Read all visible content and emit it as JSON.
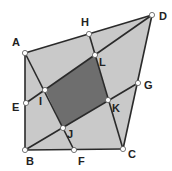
{
  "diagram": {
    "colors": {
      "outer_fill": "#c9c9c9",
      "inner_fill": "#6e6e6e",
      "stroke": "#2a2a2a",
      "point_fill": "#ffffff"
    },
    "points": {
      "A": {
        "x": 25,
        "y": 53,
        "label": "A",
        "lx": 12,
        "ly": 46
      },
      "B": {
        "x": 25,
        "y": 150,
        "label": "B",
        "lx": 26,
        "ly": 165
      },
      "C": {
        "x": 123,
        "y": 149,
        "label": "C",
        "lx": 128,
        "ly": 158
      },
      "D": {
        "x": 152,
        "y": 15,
        "label": "D",
        "lx": 159,
        "ly": 20
      },
      "E": {
        "x": 26,
        "y": 103,
        "label": "E",
        "lx": 12,
        "ly": 111
      },
      "F": {
        "x": 74,
        "y": 150,
        "label": "F",
        "lx": 78,
        "ly": 165
      },
      "G": {
        "x": 138,
        "y": 83,
        "label": "G",
        "lx": 144,
        "ly": 89
      },
      "H": {
        "x": 89,
        "y": 34,
        "label": "H",
        "lx": 81,
        "ly": 26
      },
      "I": {
        "x": 45,
        "y": 90,
        "label": "I",
        "lx": 39,
        "ly": 105
      },
      "J": {
        "x": 63,
        "y": 128,
        "label": "J",
        "lx": 67,
        "ly": 138
      },
      "K": {
        "x": 108,
        "y": 100,
        "label": "K",
        "lx": 112,
        "ly": 112
      },
      "L": {
        "x": 95,
        "y": 55,
        "label": "L",
        "lx": 99,
        "ly": 66
      }
    },
    "segments": [
      [
        "A",
        "D"
      ],
      [
        "D",
        "C"
      ],
      [
        "C",
        "B"
      ],
      [
        "B",
        "A"
      ],
      [
        "A",
        "F"
      ],
      [
        "H",
        "C"
      ],
      [
        "B",
        "G"
      ],
      [
        "E",
        "D"
      ]
    ],
    "outer_polygon": [
      "A",
      "D",
      "C",
      "B"
    ],
    "inner_polygon": [
      "I",
      "L",
      "K",
      "J"
    ]
  }
}
